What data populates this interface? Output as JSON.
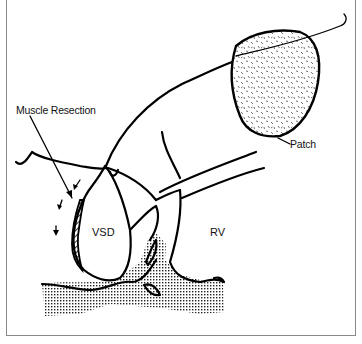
{
  "figure": {
    "type": "surgical illustration",
    "labels": {
      "muscle_resection": "Muscle Resection",
      "patch": "Patch",
      "vsd": "VSD",
      "rv": "RV"
    },
    "colors": {
      "line": "#000000",
      "frame": "#8a8a8a",
      "background": "#ffffff"
    }
  }
}
